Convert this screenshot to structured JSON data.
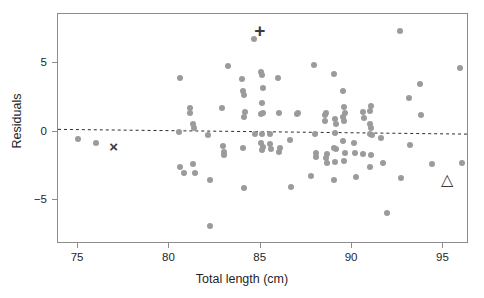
{
  "chart_data": {
    "type": "scatter",
    "title": "",
    "xlabel": "Total length (cm)",
    "ylabel": "Residuals",
    "xlim": [
      73.9,
      96.4
    ],
    "ylim": [
      -8.2,
      8.6
    ],
    "xticks": [
      75,
      80,
      85,
      90,
      95
    ],
    "yticks": [
      5,
      0,
      -5
    ],
    "xticklabels": [
      "75",
      "80",
      "85",
      "90",
      "95"
    ],
    "yticklabels": [
      "5",
      "0",
      "−5"
    ],
    "grid": false,
    "legend": false,
    "point_color": "#9b9b9b",
    "marker_color": "#3a3a3a",
    "reference_line": {
      "style": "dashed",
      "x_start": 73.9,
      "y_start": 0.1,
      "x_end": 96.4,
      "y_end": -0.25
    },
    "series": [
      {
        "name": "residuals",
        "marker": "circle",
        "points": [
          [
            75.0,
            -0.55
          ],
          [
            76.0,
            -0.8
          ],
          [
            80.6,
            3.9
          ],
          [
            80.55,
            -0.05
          ],
          [
            80.6,
            -2.6
          ],
          [
            80.8,
            -3.05
          ],
          [
            81.1,
            1.75
          ],
          [
            81.15,
            1.35
          ],
          [
            81.3,
            0.6
          ],
          [
            81.35,
            0.3
          ],
          [
            81.3,
            -2.35
          ],
          [
            81.4,
            -3.05
          ],
          [
            82.1,
            -0.25
          ],
          [
            82.2,
            -3.5
          ],
          [
            82.2,
            -6.85
          ],
          [
            82.9,
            1.75
          ],
          [
            82.95,
            -1.05
          ],
          [
            83.0,
            -1.45
          ],
          [
            83.0,
            -1.7
          ],
          [
            83.2,
            4.8
          ],
          [
            84.0,
            3.85
          ],
          [
            84.05,
            2.95
          ],
          [
            84.1,
            2.7
          ],
          [
            84.15,
            1.45
          ],
          [
            84.1,
            1.05
          ],
          [
            84.05,
            -1.2
          ],
          [
            84.1,
            -4.1
          ],
          [
            84.65,
            6.75
          ],
          [
            84.7,
            -0.2
          ],
          [
            85.0,
            4.35
          ],
          [
            85.05,
            4.15
          ],
          [
            85.1,
            3.2
          ],
          [
            85.05,
            2.1
          ],
          [
            85.1,
            1.35
          ],
          [
            85.0,
            1.3
          ],
          [
            85.05,
            -0.15
          ],
          [
            85.0,
            -0.85
          ],
          [
            85.1,
            -1.15
          ],
          [
            85.05,
            -1.35
          ],
          [
            85.5,
            -0.15
          ],
          [
            85.5,
            -0.9
          ],
          [
            85.55,
            -1.25
          ],
          [
            85.95,
            3.9
          ],
          [
            86.0,
            1.35
          ],
          [
            86.05,
            -1.2
          ],
          [
            86.0,
            -1.45
          ],
          [
            86.6,
            -0.6
          ],
          [
            86.65,
            -4.05
          ],
          [
            87.0,
            1.3
          ],
          [
            87.05,
            1.35
          ],
          [
            87.9,
            4.9
          ],
          [
            87.95,
            -0.2
          ],
          [
            88.0,
            -1.55
          ],
          [
            88.0,
            -1.85
          ],
          [
            87.75,
            -3.25
          ],
          [
            88.5,
            0.75
          ],
          [
            88.55,
            1.35
          ],
          [
            88.5,
            1.2
          ],
          [
            88.6,
            -1.65
          ],
          [
            88.55,
            -1.9
          ],
          [
            88.6,
            -2.25
          ],
          [
            89.0,
            4.25
          ],
          [
            89.05,
            0.9
          ],
          [
            89.1,
            0.55
          ],
          [
            89.05,
            -0.1
          ],
          [
            89.0,
            -1.2
          ],
          [
            89.1,
            -1.25
          ],
          [
            89.05,
            -2.2
          ],
          [
            89.0,
            -3.55
          ],
          [
            89.5,
            3.0
          ],
          [
            89.55,
            1.8
          ],
          [
            89.6,
            1.4
          ],
          [
            89.5,
            1.1
          ],
          [
            89.55,
            0.75
          ],
          [
            89.5,
            -0.7
          ],
          [
            89.6,
            -1.55
          ],
          [
            89.55,
            -2.15
          ],
          [
            90.1,
            -0.85
          ],
          [
            90.15,
            -1.55
          ],
          [
            90.2,
            -3.3
          ],
          [
            90.6,
            1.45
          ],
          [
            90.65,
            1.0
          ],
          [
            90.6,
            -1.65
          ],
          [
            91.0,
            1.55
          ],
          [
            91.05,
            1.85
          ],
          [
            91.0,
            0.55
          ],
          [
            91.05,
            0.25
          ],
          [
            91.0,
            -0.2
          ],
          [
            91.1,
            -0.25
          ],
          [
            91.05,
            -1.7
          ],
          [
            91.0,
            -2.55
          ],
          [
            91.6,
            -0.45
          ],
          [
            91.7,
            -2.3
          ],
          [
            91.9,
            -5.9
          ],
          [
            92.6,
            7.35
          ],
          [
            92.7,
            -3.35
          ],
          [
            93.1,
            2.45
          ],
          [
            93.15,
            -0.95
          ],
          [
            93.7,
            3.5
          ],
          [
            93.75,
            1.25
          ],
          [
            94.4,
            -2.35
          ],
          [
            95.9,
            4.65
          ],
          [
            96.0,
            -2.25
          ]
        ]
      }
    ],
    "annotations": [
      {
        "name": "plus-marker",
        "symbol": "+",
        "x": 85.0,
        "y": 7.35
      },
      {
        "name": "cross-marker",
        "symbol": "×",
        "x": 77.0,
        "y": -1.15
      },
      {
        "name": "triangle-marker",
        "symbol": "△",
        "x": 95.25,
        "y": -3.6
      }
    ]
  }
}
